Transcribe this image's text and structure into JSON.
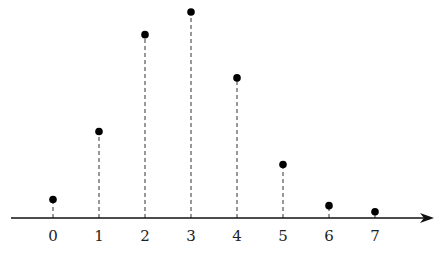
{
  "chart_data": {
    "type": "scatter",
    "subtype": "stem",
    "title": "",
    "xlabel": "",
    "ylabel": "",
    "categories": [
      "0",
      "1",
      "2",
      "3",
      "4",
      "5",
      "6",
      "7"
    ],
    "x": [
      0,
      1,
      2,
      3,
      4,
      5,
      6,
      7
    ],
    "values": [
      0.09,
      0.42,
      0.89,
      1.0,
      0.68,
      0.26,
      0.06,
      0.03
    ],
    "ylim": [
      0,
      1.05
    ],
    "grid": false,
    "legend": null,
    "axis": {
      "x_arrow": true,
      "y_axis_visible": false
    },
    "stem_style": "dashed",
    "marker": "filled-circle",
    "color": "#000000"
  }
}
